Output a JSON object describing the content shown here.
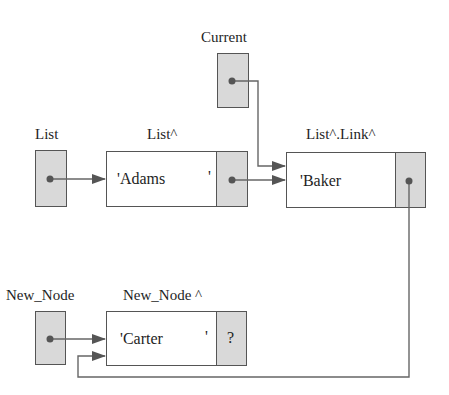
{
  "labels": {
    "current": "Current",
    "list": "List",
    "list_deref": "List^",
    "list_link_deref": "List^.Link^",
    "new_node": "New_Node",
    "new_node_deref": "New_Node ^"
  },
  "nodes": [
    {
      "name": "Adams",
      "data": "'Adams",
      "close_quote": "'",
      "link": "•"
    },
    {
      "name": "Baker",
      "data": "'Baker",
      "close_quote": "",
      "link": "•"
    },
    {
      "name": "Carter",
      "data": "'Carter",
      "close_quote": "'",
      "link": "?"
    }
  ],
  "colors": {
    "line": "#555555",
    "pointer_fill": "#d9d9d9",
    "dot": "#555555"
  }
}
